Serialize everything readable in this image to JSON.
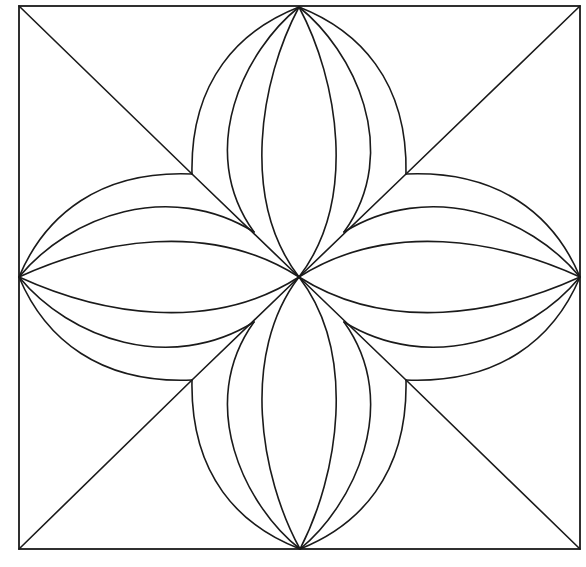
{
  "diagram": {
    "type": "geometric-quilt-block",
    "colors": {
      "background": "#ffffff",
      "line": "#1a1a1a"
    },
    "frame": {
      "x1": 19,
      "y1": 6,
      "x2": 580,
      "y2": 549
    },
    "center": {
      "x": 299,
      "y": 277
    },
    "petal_tips": [
      {
        "name": "top",
        "x": 299,
        "y": 7
      },
      {
        "name": "right",
        "x": 580,
        "y": 277
      },
      {
        "name": "bottom",
        "x": 300,
        "y": 549
      },
      {
        "name": "left",
        "x": 19,
        "y": 277
      }
    ],
    "outer_junctions": [
      {
        "name": "top-left",
        "x": 192,
        "y": 174
      },
      {
        "name": "top-right",
        "x": 406,
        "y": 174
      },
      {
        "name": "bottom-right",
        "x": 406,
        "y": 380
      },
      {
        "name": "bottom-left",
        "x": 192,
        "y": 380
      }
    ],
    "inner_junctions": [
      {
        "name": "top-left",
        "x": 254,
        "y": 232
      },
      {
        "name": "top-right",
        "x": 344,
        "y": 232
      },
      {
        "name": "bottom-right",
        "x": 344,
        "y": 322
      },
      {
        "name": "bottom-left",
        "x": 254,
        "y": 322
      }
    ],
    "arcs_per_petal_side": 3,
    "petal_count": 4
  }
}
